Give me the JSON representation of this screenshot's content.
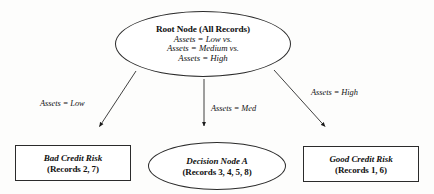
{
  "diagram": {
    "type": "decision-tree",
    "background_color": "#fdfdfc",
    "stroke_color": "#2b2b2b",
    "text_color": "#111111"
  },
  "root": {
    "shape": "ellipse",
    "title": "Root Node (All Records)",
    "lines": [
      "Assets = Low vs.",
      "Assets = Medium vs.",
      "Assets = High"
    ]
  },
  "edges": [
    {
      "id": "low",
      "label": "Assets = Low",
      "from": "root",
      "to": "leaf-bad"
    },
    {
      "id": "med",
      "label": "Assets = Med",
      "from": "root",
      "to": "decision-node-a"
    },
    {
      "id": "high",
      "label": "Assets = High",
      "from": "root",
      "to": "leaf-good"
    }
  ],
  "children": [
    {
      "id": "leaf-bad",
      "shape": "rectangle",
      "title": "Bad Credit Risk",
      "records": "(Records 2, 7)"
    },
    {
      "id": "decision-node-a",
      "shape": "ellipse",
      "title": "Decision Node A",
      "records": "(Records 3, 4, 5, 8)"
    },
    {
      "id": "leaf-good",
      "shape": "rectangle",
      "title": "Good Credit Risk",
      "records": "(Records 1, 6)"
    }
  ]
}
